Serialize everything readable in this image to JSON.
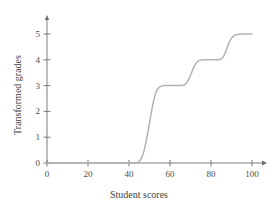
{
  "chart_data": {
    "type": "line",
    "title": "",
    "xlabel": "Student scores",
    "ylabel": "Transformed grades",
    "xlim": [
      0,
      100
    ],
    "ylim": [
      0,
      5
    ],
    "xticks": [
      0,
      20,
      40,
      60,
      80,
      100
    ],
    "xtick_labels": [
      "0",
      "20",
      "40",
      "60",
      "80",
      "100"
    ],
    "yticks": [
      0,
      1,
      2,
      3,
      4,
      5
    ],
    "ytick_labels": [
      "0",
      "1",
      "2",
      "3",
      "4",
      "5"
    ],
    "grid": false,
    "legend": "none",
    "axis_arrows": true,
    "line_color": "#b3b3b3",
    "axis_color": "#6e6e6e",
    "text_color": "#3f3f3f",
    "series": [
      {
        "name": "transformed grade curve",
        "x": [
          0,
          5,
          10,
          15,
          20,
          25,
          30,
          35,
          40,
          42,
          44,
          45,
          46,
          47,
          48,
          49,
          50,
          51,
          52,
          53,
          54,
          55,
          56,
          57,
          58,
          60,
          62,
          64,
          66,
          67,
          68,
          69,
          70,
          71,
          72,
          73,
          74,
          75,
          77,
          79,
          81,
          83,
          84,
          85,
          86,
          87,
          88,
          89,
          90,
          91,
          92,
          93,
          94,
          95,
          96,
          98,
          100
        ],
        "y": [
          0,
          0,
          0,
          0,
          0,
          0,
          0,
          0,
          0,
          0,
          0.02,
          0.07,
          0.18,
          0.38,
          0.7,
          1.1,
          1.55,
          2.0,
          2.4,
          2.7,
          2.87,
          2.95,
          2.98,
          3.0,
          3.0,
          3.0,
          3.0,
          3.0,
          3.01,
          3.03,
          3.1,
          3.22,
          3.4,
          3.6,
          3.78,
          3.9,
          3.96,
          3.99,
          4.0,
          4.0,
          4.0,
          4.0,
          4.01,
          4.04,
          4.12,
          4.28,
          4.5,
          4.7,
          4.84,
          4.92,
          4.96,
          4.98,
          4.99,
          5.0,
          5.0,
          5.0,
          5.0
        ]
      }
    ]
  },
  "axes": {
    "x_tick_labels": [
      "0",
      "20",
      "40",
      "60",
      "80",
      "100"
    ],
    "y_tick_labels": [
      "0",
      "1",
      "2",
      "3",
      "4",
      "5"
    ],
    "x_axis_title": "Student scores",
    "y_axis_title": "Transformed grades"
  }
}
